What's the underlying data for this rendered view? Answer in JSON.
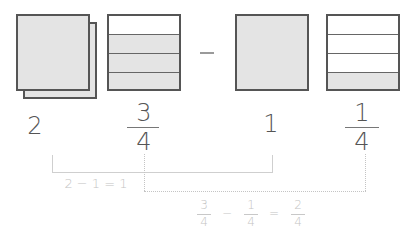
{
  "figure": {
    "colors": {
      "shape_border": "#555555",
      "shape_fill": "#e4e4e4",
      "empty_fill": "#ffffff",
      "label_text": "#555555",
      "annotation_text": "#c4c4c4"
    }
  },
  "minuend": {
    "whole_label": "2",
    "fraction": {
      "numerator": "3",
      "denominator": "4"
    },
    "whole_model": {
      "squares": 2,
      "filled": true
    },
    "fraction_model": {
      "parts": 4,
      "filled_parts": 3,
      "empty_position": "top"
    }
  },
  "operator": {
    "symbol": "−"
  },
  "subtrahend": {
    "whole_label": "1",
    "fraction": {
      "numerator": "1",
      "denominator": "4"
    },
    "whole_model": {
      "squares": 1,
      "filled": true
    },
    "fraction_model": {
      "parts": 4,
      "filled_parts": 1,
      "filled_position": "bottom"
    }
  },
  "annotations": {
    "whole_equation": "2 − 1 = 1",
    "fraction_equation": {
      "a": {
        "numerator": "3",
        "denominator": "4"
      },
      "op": "−",
      "b": {
        "numerator": "1",
        "denominator": "4"
      },
      "eq": "=",
      "result": {
        "numerator": "2",
        "denominator": "4"
      }
    }
  }
}
